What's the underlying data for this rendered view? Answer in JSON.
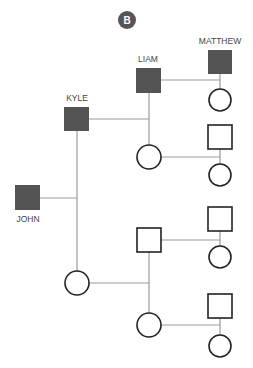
{
  "badge": {
    "label": "B",
    "color": "#5a5353"
  },
  "colors": {
    "filled": "#545454",
    "line": "#9a9a9a",
    "stroke": "#222222"
  },
  "people": {
    "matthew": {
      "name": "MATTHEW",
      "shape": "square",
      "filled": true
    },
    "liam": {
      "name": "LIAM",
      "shape": "square",
      "filled": true
    },
    "kyle": {
      "name": "KYLE",
      "shape": "square",
      "filled": true
    },
    "john": {
      "name": "JOHN",
      "shape": "square",
      "filled": true
    }
  },
  "legend_note": "Pedigree chart: filled squares are named males; open squares = males, open circles = females"
}
